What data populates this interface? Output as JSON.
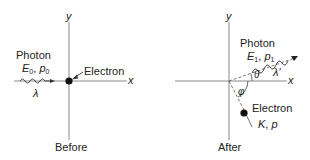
{
  "diagram": {
    "type": "compton-scattering",
    "panels": [
      {
        "id": "before",
        "caption": "Before",
        "axes": {
          "x_label": "x",
          "y_label": "y"
        },
        "photon": {
          "title": "Photon",
          "energy": "E",
          "energy_sub": "0",
          "momentum": "p",
          "momentum_sub": "0",
          "wavelength": "λ"
        },
        "electron": {
          "label": "Electron"
        }
      },
      {
        "id": "after",
        "caption": "After",
        "axes": {
          "x_label": "x",
          "y_label": "y"
        },
        "photon": {
          "title": "Photon",
          "energy": "E",
          "energy_sub": "1",
          "momentum": "p",
          "momentum_sub": "1",
          "wavelength": "λ′",
          "angle": "θ"
        },
        "electron": {
          "label": "Electron",
          "energy": "K",
          "momentum": "p",
          "angle": "φ"
        }
      }
    ]
  },
  "colors": {
    "axis": "#888888",
    "ink": "#222222",
    "dot": "#111111"
  }
}
